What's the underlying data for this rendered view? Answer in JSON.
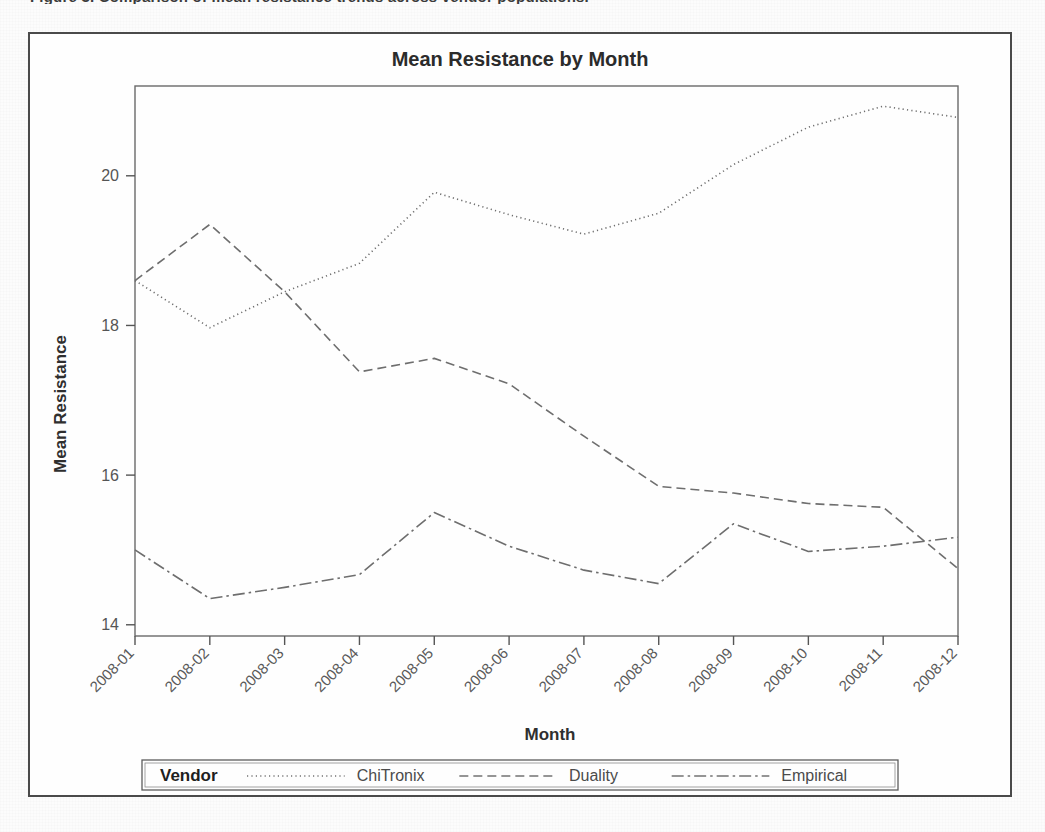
{
  "page": {
    "clipped_header_text": "Figure 3. Comparison of mean resistance trends across vendor populations."
  },
  "chart_data": {
    "type": "line",
    "title": "Mean Resistance by Month",
    "xlabel": "Month",
    "ylabel": "Mean Resistance",
    "categories": [
      "2008-01",
      "2008-02",
      "2008-03",
      "2008-04",
      "2008-05",
      "2008-06",
      "2008-07",
      "2008-08",
      "2008-09",
      "2008-10",
      "2008-11",
      "2008-12"
    ],
    "yticks": [
      14,
      16,
      18,
      20
    ],
    "ylim": [
      13.85,
      21.2
    ],
    "grid": false,
    "legend_position": "bottom",
    "legend_title": "Vendor",
    "xtick_rotation": -45,
    "series": [
      {
        "name": "ChiTronix",
        "dash": "dotted",
        "color": "#6e6e6e",
        "values": [
          18.6,
          17.97,
          18.45,
          18.83,
          19.78,
          19.48,
          19.22,
          19.5,
          20.15,
          20.65,
          20.93,
          20.78
        ]
      },
      {
        "name": "Duality",
        "dash": "dashed",
        "color": "#6e6e6e",
        "values": [
          18.6,
          19.35,
          18.45,
          17.38,
          17.56,
          17.22,
          16.52,
          15.85,
          15.76,
          15.62,
          15.57,
          14.75
        ]
      },
      {
        "name": "Empirical",
        "dash": "dash-dot",
        "color": "#6e6e6e",
        "values": [
          15.0,
          14.35,
          14.5,
          14.67,
          15.5,
          15.05,
          14.73,
          14.55,
          15.35,
          14.98,
          15.05,
          15.17
        ]
      }
    ]
  },
  "legend": {
    "title": "Vendor",
    "entries": [
      {
        "label": "ChiTronix",
        "dash": "dotted"
      },
      {
        "label": "Duality",
        "dash": "dashed"
      },
      {
        "label": "Empirical",
        "dash": "dash-dot"
      }
    ]
  },
  "colors": {
    "frame": "#4a4a4a",
    "axis": "#555555",
    "series": "#6e6e6e",
    "text": "#2b2b2b",
    "background": "#fefefe"
  }
}
